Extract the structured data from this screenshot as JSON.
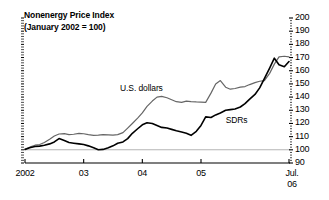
{
  "figure": {
    "title_line1": "Nonenergy Price Index",
    "title_line2": "(January 2002 = 100)",
    "background_color": "#ffffff",
    "axis_color": "#000000"
  },
  "chart_data": {
    "type": "line",
    "title": "Nonenergy Price Index (January 2002 = 100)",
    "subtitle": "(January 2002 = 100)",
    "xlabel": "",
    "ylabel": "",
    "ylim": [
      90,
      200
    ],
    "ytick_values": [
      90,
      100,
      110,
      120,
      130,
      140,
      150,
      160,
      170,
      180,
      190,
      200
    ],
    "ytick_labels": [
      "90",
      "100",
      "110",
      "120",
      "130",
      "140",
      "150",
      "160",
      "170",
      "180",
      "190",
      "200"
    ],
    "yaxis_position": "right",
    "xlim": [
      2002.0,
      2006.5
    ],
    "xtick_values": [
      2002.0,
      2003.0,
      2004.0,
      2005.0,
      2006.5
    ],
    "xtick_labels": [
      "2002",
      "03",
      "04",
      "05",
      "Jul. 06"
    ],
    "xtick_label_lines": [
      [
        "2002"
      ],
      [
        "03"
      ],
      [
        "04"
      ],
      [
        "05"
      ],
      [
        "Jul.",
        "06"
      ]
    ],
    "grid": false,
    "reference_line": {
      "value": 100,
      "color": "#b4b4b4"
    },
    "legend_position": "inline-annotation",
    "series": [
      {
        "name": "U.S. dollars",
        "color": "#666666",
        "label_x": 2003.62,
        "label_y": 146,
        "x": [
          2002.0,
          2002.08,
          2002.17,
          2002.25,
          2002.33,
          2002.42,
          2002.5,
          2002.58,
          2002.67,
          2002.75,
          2002.83,
          2002.92,
          2003.0,
          2003.08,
          2003.17,
          2003.25,
          2003.33,
          2003.42,
          2003.5,
          2003.58,
          2003.67,
          2003.75,
          2003.83,
          2003.92,
          2004.0,
          2004.08,
          2004.17,
          2004.25,
          2004.33,
          2004.42,
          2004.5,
          2004.58,
          2004.67,
          2004.75,
          2004.83,
          2004.92,
          2005.0,
          2005.08,
          2005.17,
          2005.25,
          2005.33,
          2005.42,
          2005.5,
          2005.58,
          2005.67,
          2005.75,
          2005.83,
          2005.92,
          2006.0,
          2006.08,
          2006.17,
          2006.25,
          2006.33,
          2006.42,
          2006.5
        ],
        "values": [
          100.5,
          102.0,
          103.5,
          104.0,
          105.5,
          108.0,
          110.5,
          112.0,
          112.3,
          111.5,
          111.8,
          112.5,
          112.2,
          111.5,
          111.0,
          111.2,
          111.5,
          111.3,
          111.2,
          111.5,
          113.0,
          116.5,
          120.0,
          124.0,
          128.0,
          133.0,
          137.0,
          140.0,
          140.5,
          139.5,
          138.0,
          136.5,
          136.0,
          137.0,
          136.5,
          136.3,
          136.2,
          136.0,
          143.0,
          150.0,
          152.5,
          147.5,
          146.0,
          146.5,
          147.5,
          148.0,
          149.5,
          151.0,
          152.0,
          152.5,
          158.0,
          165.0,
          170.5,
          171.0,
          170.5
        ]
      },
      {
        "name": "SDRs",
        "color": "#000000",
        "label_x": 2005.42,
        "label_y": 122,
        "x": [
          2002.0,
          2002.08,
          2002.17,
          2002.25,
          2002.33,
          2002.42,
          2002.5,
          2002.58,
          2002.67,
          2002.75,
          2002.83,
          2002.92,
          2003.0,
          2003.08,
          2003.17,
          2003.25,
          2003.33,
          2003.42,
          2003.5,
          2003.58,
          2003.67,
          2003.75,
          2003.83,
          2003.92,
          2004.0,
          2004.08,
          2004.17,
          2004.25,
          2004.33,
          2004.42,
          2004.5,
          2004.58,
          2004.67,
          2004.75,
          2004.83,
          2004.92,
          2005.0,
          2005.08,
          2005.17,
          2005.25,
          2005.33,
          2005.42,
          2005.5,
          2005.58,
          2005.67,
          2005.75,
          2005.83,
          2005.92,
          2006.0,
          2006.08,
          2006.17,
          2006.25,
          2006.33,
          2006.42,
          2006.5
        ],
        "values": [
          100.3,
          101.5,
          102.5,
          102.8,
          103.5,
          104.5,
          106.0,
          108.5,
          107.0,
          105.5,
          105.0,
          104.5,
          104.0,
          103.0,
          101.5,
          100.0,
          100.3,
          101.5,
          103.0,
          105.0,
          106.0,
          108.5,
          112.5,
          116.0,
          119.0,
          120.5,
          120.0,
          118.5,
          117.0,
          116.5,
          115.5,
          114.5,
          113.5,
          112.5,
          111.0,
          114.0,
          118.5,
          125.0,
          124.5,
          126.5,
          128.0,
          130.0,
          130.5,
          131.0,
          132.5,
          135.0,
          138.5,
          142.0,
          147.0,
          154.0,
          162.0,
          169.5,
          164.5,
          163.0,
          167.0
        ]
      }
    ]
  },
  "annotations": {
    "series_labels": [
      "U.S. dollars",
      "SDRs"
    ]
  }
}
